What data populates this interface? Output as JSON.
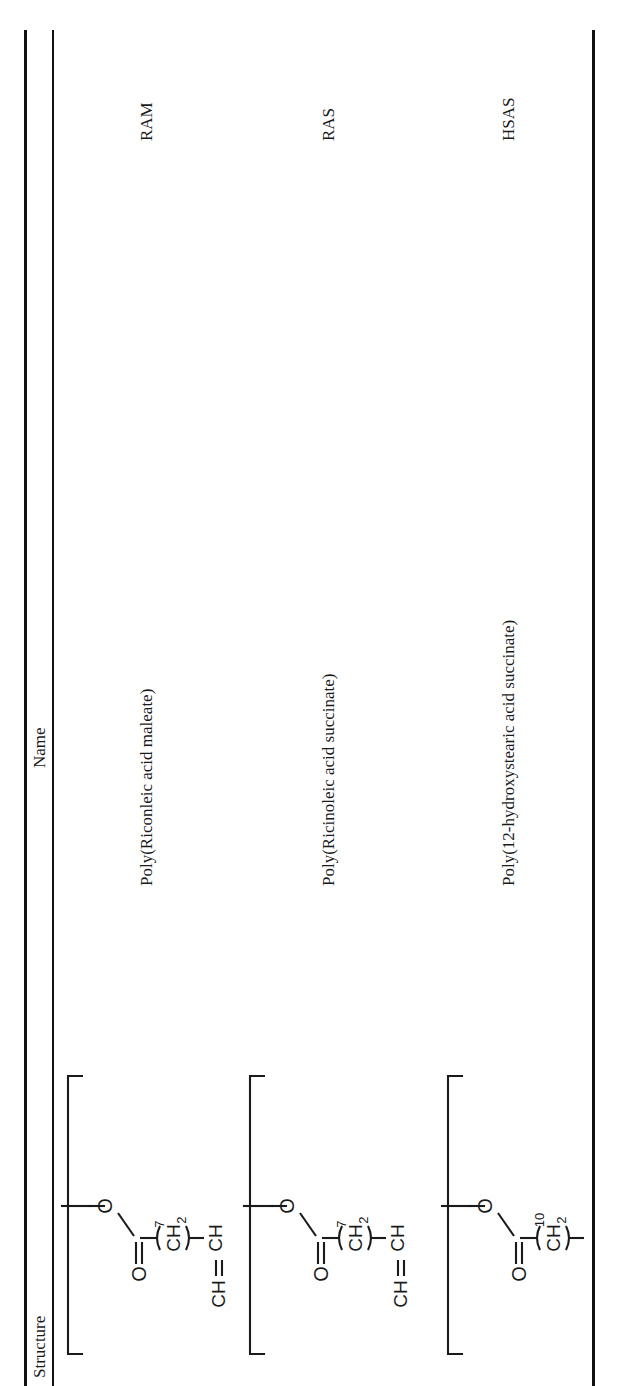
{
  "table": {
    "columns": {
      "structure": "Structure",
      "name": "Name",
      "abbreviation": ""
    },
    "rows": [
      {
        "abbr": "RAM",
        "name": "Poly(Riconleic acid maleate)",
        "structure_id": "ram-structure",
        "repeat_label": "n",
        "groups": [
          "CH",
          "3",
          "CH",
          "2",
          "4",
          "CH",
          "O",
          "O",
          "CH",
          "CH",
          "O",
          "O",
          "CH",
          "CH",
          "2",
          "CH",
          "CH",
          "CH",
          "2",
          "7",
          "O",
          "O"
        ]
      },
      {
        "abbr": "RAS",
        "name": "Poly(Ricinoleic acid succinate)",
        "structure_id": "ras-structure",
        "repeat_label": "n",
        "groups": [
          "CH",
          "3",
          "CH",
          "2",
          "4",
          "CH",
          "O",
          "O",
          "CH",
          "2",
          "7",
          "O",
          "O",
          "CH",
          "CH",
          "2",
          "CH",
          "CH",
          "CH",
          "2",
          "7",
          "O",
          "O"
        ]
      },
      {
        "abbr": "HSAS",
        "name": "Poly(12-hydroxystearic acid succinate)",
        "structure_id": "hsas-structure",
        "repeat_label": "n",
        "groups": [
          "CH",
          "3",
          "CH",
          "2",
          "4",
          "CH",
          "O",
          "O",
          "CH",
          "2",
          "7",
          "O",
          "O",
          "CH",
          "2",
          "10",
          "O",
          "O"
        ]
      }
    ]
  },
  "chemistry": {
    "labels": {
      "ch3": "CH",
      "ch2": "CH",
      "ch": "CH",
      "o": "O",
      "sub_3": "3",
      "sub_2": "2",
      "sub_4": "4",
      "sub_7": "7",
      "sub_10": "10",
      "n": "n"
    }
  },
  "colors": {
    "ink": "#1a1a1a",
    "rule": "#111111",
    "page": "#ffffff"
  }
}
